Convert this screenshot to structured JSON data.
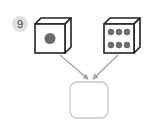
{
  "problem": {
    "number": "9"
  },
  "dice": [
    {
      "name": "die-left",
      "pips": 1
    },
    {
      "name": "die-right",
      "pips": 6
    }
  ],
  "answer_box": {
    "value": ""
  },
  "colors": {
    "outline": "#222222",
    "pip": "#6b6b6b",
    "arrow": "#a6a6a6",
    "box_border": "#c8c8c8",
    "badge_bg": "#e0e0e0"
  }
}
